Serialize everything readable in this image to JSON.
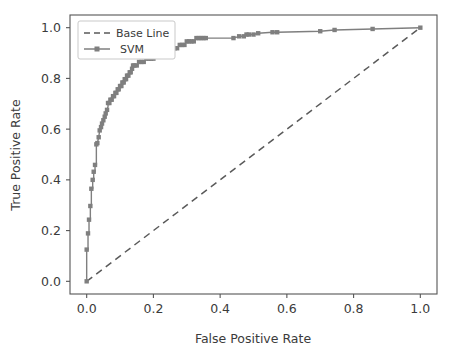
{
  "chart_data": {
    "type": "line",
    "title": "",
    "xlabel": "False Positive Rate",
    "ylabel": "True Positive Rate",
    "xlim": [
      -0.05,
      1.05
    ],
    "ylim": [
      -0.05,
      1.05
    ],
    "grid": false,
    "legend_position": "upper left",
    "xticks": [
      "0.0",
      "0.2",
      "0.4",
      "0.6",
      "0.8",
      "1.0"
    ],
    "xtick_values": [
      0.0,
      0.2,
      0.4,
      0.6,
      0.8,
      1.0
    ],
    "yticks": [
      "0.0",
      "0.2",
      "0.4",
      "0.6",
      "0.8",
      "1.0"
    ],
    "ytick_values": [
      0.0,
      0.2,
      0.4,
      0.6,
      0.8,
      1.0
    ],
    "colors": {
      "baseline": "#5a5a5a",
      "svm": "#7f7f7f",
      "axis": "#555555",
      "text": "#3b3b3b",
      "background": "#ffffff"
    },
    "series": [
      {
        "name": "Base Line",
        "style": "dashed",
        "marker": "none",
        "color": "#5a5a5a",
        "x": [
          0.0,
          1.0
        ],
        "y": [
          0.0,
          1.0
        ]
      },
      {
        "name": "SVM",
        "style": "solid",
        "marker": "square",
        "color": "#7f7f7f",
        "x": [
          0.0,
          0.0,
          0.0,
          0.004,
          0.004,
          0.007,
          0.007,
          0.011,
          0.011,
          0.014,
          0.014,
          0.018,
          0.018,
          0.021,
          0.021,
          0.025,
          0.025,
          0.029,
          0.029,
          0.032,
          0.036,
          0.039,
          0.043,
          0.046,
          0.05,
          0.054,
          0.057,
          0.061,
          0.064,
          0.064,
          0.068,
          0.071,
          0.075,
          0.079,
          0.082,
          0.086,
          0.089,
          0.093,
          0.096,
          0.1,
          0.104,
          0.107,
          0.111,
          0.114,
          0.118,
          0.121,
          0.125,
          0.129,
          0.132,
          0.136,
          0.139,
          0.143,
          0.15,
          0.157,
          0.164,
          0.171,
          0.179,
          0.186,
          0.193,
          0.2,
          0.207,
          0.214,
          0.221,
          0.229,
          0.236,
          0.243,
          0.25,
          0.257,
          0.264,
          0.271,
          0.279,
          0.286,
          0.293,
          0.3,
          0.307,
          0.314,
          0.321,
          0.329,
          0.336,
          0.343,
          0.35,
          0.357,
          0.44,
          0.457,
          0.471,
          0.479,
          0.486,
          0.5,
          0.514,
          0.557,
          0.571,
          0.7,
          0.743,
          0.857,
          1.0
        ],
        "y": [
          0.0,
          0.107,
          0.125,
          0.125,
          0.189,
          0.189,
          0.243,
          0.243,
          0.297,
          0.297,
          0.365,
          0.365,
          0.4,
          0.4,
          0.432,
          0.432,
          0.459,
          0.459,
          0.54,
          0.545,
          0.568,
          0.595,
          0.608,
          0.622,
          0.635,
          0.649,
          0.662,
          0.676,
          0.689,
          0.703,
          0.703,
          0.716,
          0.716,
          0.73,
          0.73,
          0.743,
          0.743,
          0.757,
          0.757,
          0.77,
          0.77,
          0.784,
          0.784,
          0.797,
          0.797,
          0.811,
          0.811,
          0.824,
          0.824,
          0.838,
          0.851,
          0.851,
          0.851,
          0.865,
          0.865,
          0.865,
          0.878,
          0.878,
          0.878,
          0.878,
          0.892,
          0.892,
          0.892,
          0.892,
          0.892,
          0.905,
          0.905,
          0.905,
          0.919,
          0.919,
          0.932,
          0.932,
          0.932,
          0.946,
          0.946,
          0.946,
          0.946,
          0.959,
          0.959,
          0.959,
          0.959,
          0.959,
          0.959,
          0.966,
          0.966,
          0.973,
          0.973,
          0.973,
          0.978,
          0.982,
          0.982,
          0.986,
          0.991,
          0.995,
          1.0
        ],
        "markers_x": [
          0.0,
          0.0,
          0.004,
          0.007,
          0.011,
          0.014,
          0.018,
          0.021,
          0.025,
          0.029,
          0.032,
          0.036,
          0.039,
          0.043,
          0.046,
          0.05,
          0.054,
          0.057,
          0.061,
          0.064,
          0.068,
          0.071,
          0.075,
          0.079,
          0.082,
          0.086,
          0.089,
          0.093,
          0.096,
          0.1,
          0.104,
          0.107,
          0.111,
          0.114,
          0.118,
          0.121,
          0.125,
          0.129,
          0.132,
          0.136,
          0.139,
          0.143,
          0.15,
          0.157,
          0.164,
          0.171,
          0.179,
          0.186,
          0.193,
          0.2,
          0.207,
          0.214,
          0.221,
          0.229,
          0.236,
          0.243,
          0.25,
          0.257,
          0.264,
          0.271,
          0.279,
          0.286,
          0.293,
          0.3,
          0.307,
          0.314,
          0.321,
          0.329,
          0.336,
          0.343,
          0.35,
          0.357,
          0.44,
          0.457,
          0.471,
          0.479,
          0.486,
          0.5,
          0.514,
          0.557,
          0.571,
          0.7,
          0.743,
          0.857,
          1.0
        ],
        "markers_y": [
          0.0,
          0.125,
          0.189,
          0.243,
          0.297,
          0.365,
          0.4,
          0.432,
          0.459,
          0.54,
          0.545,
          0.568,
          0.595,
          0.608,
          0.622,
          0.635,
          0.649,
          0.662,
          0.676,
          0.703,
          0.703,
          0.716,
          0.716,
          0.73,
          0.73,
          0.743,
          0.743,
          0.757,
          0.757,
          0.77,
          0.77,
          0.784,
          0.784,
          0.797,
          0.797,
          0.811,
          0.811,
          0.824,
          0.824,
          0.838,
          0.851,
          0.851,
          0.851,
          0.865,
          0.865,
          0.865,
          0.878,
          0.878,
          0.878,
          0.878,
          0.892,
          0.892,
          0.892,
          0.892,
          0.892,
          0.905,
          0.905,
          0.905,
          0.919,
          0.919,
          0.932,
          0.932,
          0.932,
          0.946,
          0.946,
          0.946,
          0.946,
          0.959,
          0.959,
          0.959,
          0.959,
          0.959,
          0.959,
          0.966,
          0.966,
          0.973,
          0.973,
          0.973,
          0.978,
          0.982,
          0.982,
          0.986,
          0.991,
          0.995,
          1.0
        ]
      }
    ],
    "legend": [
      {
        "label": "Base Line",
        "style": "dashed",
        "marker": "none",
        "color": "#5a5a5a"
      },
      {
        "label": "SVM",
        "style": "solid",
        "marker": "square",
        "color": "#7f7f7f"
      }
    ]
  }
}
